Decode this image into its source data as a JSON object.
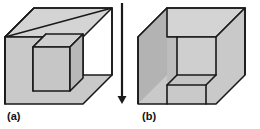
{
  "figure": {
    "background_color": "#ffffff",
    "outline_color": "#1a1a1a",
    "outline_width": 1.6,
    "colors": {
      "top_face": "#d4d4d4",
      "left_face": "#b3b3b3",
      "front_face": "#c9c9c9",
      "inner_left_face": "#bdbdbd",
      "inner_top_face": "#c6c6c6",
      "inner_back_face": "#cfcfcf",
      "arrow": "#1a1a1a",
      "label_text": "#111111"
    },
    "panels": [
      {
        "id": "panel-a",
        "label": "(a)",
        "description": "Large isometric cuboid with a smaller separate cube nested in front of its inner corner",
        "label_position": {
          "x": 7,
          "y": 110
        }
      },
      {
        "id": "panel-b",
        "label": "(b)",
        "description": "Same cuboid with a cubical notch removed from the near corner revealing interior faces",
        "label_position": {
          "x": 142,
          "y": 110
        }
      }
    ],
    "arrow": {
      "name": "downward-arrow",
      "direction": "down",
      "x": 122,
      "y_start": 3,
      "y_end": 104,
      "head_width": 9,
      "head_height": 9
    }
  }
}
